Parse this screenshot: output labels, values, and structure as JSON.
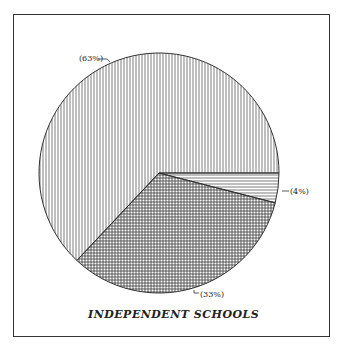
{
  "chart_data": {
    "type": "pie",
    "title": "INDEPENDENT SCHOOLS",
    "slices": [
      {
        "label": "(4%)",
        "value": 4,
        "pattern": "horizontal-lines"
      },
      {
        "label": "(33%)",
        "value": 33,
        "pattern": "crosshatch"
      },
      {
        "label": "(63%)",
        "value": 63,
        "pattern": "vertical-lines"
      }
    ],
    "start_angle_deg": 0,
    "direction": "clockwise",
    "legend": "none"
  },
  "labels": {
    "s63": "(63%)",
    "s4": "(4%)",
    "s33": "(33%)",
    "title": "INDEPENDENT SCHOOLS"
  },
  "colors": {
    "line": "#333333",
    "background": "#ffffff"
  }
}
